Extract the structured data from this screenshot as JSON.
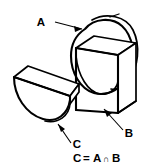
{
  "figure": {
    "background_color": "#ffffff",
    "line_color": "#000000"
  },
  "labels": {
    "a": "A",
    "b": "B",
    "c": "C"
  },
  "caption": {
    "lhs": "C",
    "equals": "=",
    "operand_left": "A",
    "operator": "∩",
    "operand_right": "B",
    "full": "C = A ∩ B"
  },
  "solids": {
    "cylinder": {
      "name": "A",
      "description": "circular disc / cylinder",
      "center_x": 103,
      "center_y": 57,
      "radius_x": 33,
      "radius_y": 40
    },
    "block": {
      "name": "B",
      "description": "rectangular block slab",
      "front_left_x": 76,
      "front_top_y": 38,
      "front_bottom_y": 108,
      "depth_x": 18,
      "depth_y": -12
    },
    "result": {
      "name": "C",
      "description": "half-disc slab resulting from intersection",
      "center_x": 49,
      "center_y": 82
    }
  }
}
